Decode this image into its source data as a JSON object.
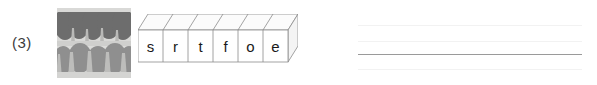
{
  "item": {
    "number_label": "(3)",
    "answer_word": "forest"
  },
  "photo": {
    "alt_name": "forest-photograph",
    "description": "grayscale photo of rows of trees in a forest",
    "colors": {
      "sky": "#d9d9d7",
      "tree_dark": "#6d6d6d",
      "tree_mid": "#8f8f8f",
      "tree_light": "#b0b0b0",
      "ground": "#cfcfcd",
      "trunk": "#a9a9a9"
    }
  },
  "letter_boxes": {
    "letters": [
      "s",
      "r",
      "t",
      "f",
      "o",
      "e"
    ],
    "face_fill": "#ffffff",
    "top_fill": "#fbfbfb",
    "side_fill": "#f4f4f4",
    "stroke": "#8c8c8c"
  },
  "answer_lines": {
    "count": 4,
    "lines": [
      {
        "name": "rule-1",
        "top": 25,
        "weight": "faint",
        "color": "#f2f2f2"
      },
      {
        "name": "rule-2",
        "top": 41,
        "weight": "faint",
        "color": "#f2f2f2"
      },
      {
        "name": "rule-3",
        "top": 54,
        "weight": "strong",
        "color": "#9a9a9a"
      },
      {
        "name": "rule-4",
        "top": 69,
        "weight": "faint",
        "color": "#f2f2f2"
      }
    ],
    "value": ""
  }
}
